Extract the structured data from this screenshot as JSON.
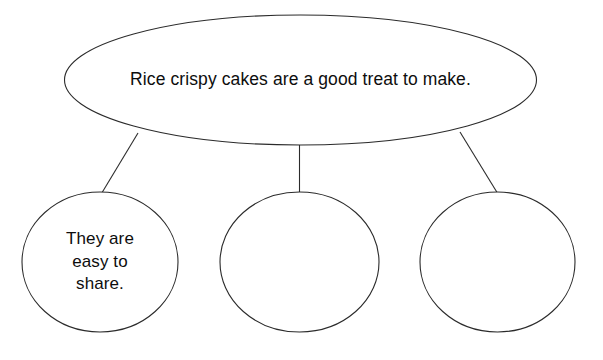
{
  "diagram": {
    "type": "idea-web",
    "title": "",
    "stroke_color": "#2b2b2b",
    "fill_color": "#ffffff",
    "text_color": "#0d0d0d",
    "main_idea": {
      "shape": "ellipse",
      "text": "Rice crispy cakes are a good treat to make."
    },
    "branches": [
      {
        "shape": "circle",
        "text": "They are\neasy to\nshare.",
        "filled_in": true
      },
      {
        "shape": "circle",
        "text": "",
        "filled_in": false
      },
      {
        "shape": "circle",
        "text": "",
        "filled_in": false
      }
    ]
  }
}
